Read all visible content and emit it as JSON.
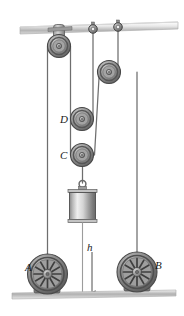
{
  "figure": {
    "background_color": "#ffffff",
    "width": 184,
    "height": 316
  },
  "labels": {
    "pulley_d": "D",
    "pulley_c": "C",
    "wheel_a": "A",
    "wheel_b": "B",
    "height_dimension": "h"
  },
  "colors": {
    "rope": "#6e6e6e",
    "pulley_dark": "#5d5d5d",
    "pulley_mid": "#8f8f8f",
    "pulley_light": "#b8b8b8",
    "ceiling": "#c9c9c9",
    "ground": "#bdbdbd",
    "block_light": "#efefef",
    "block_dark": "#707070",
    "label_text": "#1a1a1a"
  },
  "components": {
    "ceiling": "ceiling-beam",
    "ground": "ground-line",
    "top_left_pulley": "pulley-top-left",
    "upper_right_pulley": "pulley-upper-right",
    "movable_pulley_d": "pulley-d",
    "movable_pulley_c": "pulley-c",
    "anchor_left": "ceiling-anchor-left",
    "anchor_right": "ceiling-anchor-right",
    "weight_block": "hanging-weight-block",
    "wheel_left": "spoked-wheel-a",
    "wheel_right": "spoked-wheel-b",
    "dimension_line": "height-dimension-arrow"
  }
}
